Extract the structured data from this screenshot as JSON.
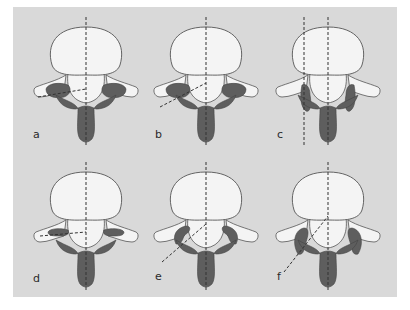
{
  "figure": {
    "background_color": "#d9d9d9",
    "body_color": "#f4f4f4",
    "bone_color": "#5e5e5e",
    "outline_color": "#555555",
    "panels": [
      {
        "label": "a",
        "cx": 86,
        "cy": 55,
        "variant": "a"
      },
      {
        "label": "b",
        "cx": 206,
        "cy": 55,
        "variant": "b"
      },
      {
        "label": "c",
        "cx": 328,
        "cy": 55,
        "variant": "c"
      },
      {
        "label": "d",
        "cx": 86,
        "cy": 200,
        "variant": "d"
      },
      {
        "label": "e",
        "cx": 206,
        "cy": 200,
        "variant": "e"
      },
      {
        "label": "f",
        "cx": 328,
        "cy": 200,
        "variant": "f"
      }
    ]
  }
}
